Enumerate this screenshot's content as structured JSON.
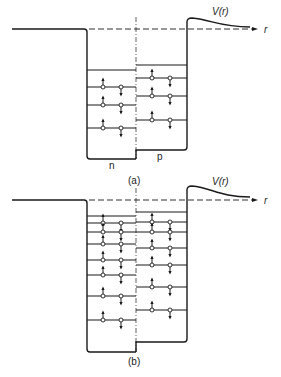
{
  "colors": {
    "line": "#1a1a1a",
    "background": "#ffffff",
    "label": "#222222"
  },
  "icons": {
    "spin_up": "arrow-up",
    "spin_down": "arrow-down",
    "particle": "open-circle"
  },
  "panels": [
    {
      "id": "a",
      "caption": "(a)",
      "potential_label": "V(r)",
      "axis_label": "r",
      "left_region_label": "n",
      "right_region_label": "p",
      "geometry": {
        "baseline_y": 29,
        "left_x": 12,
        "n_wall_x": 87,
        "center_x": 136,
        "p_wall_x": 187,
        "n_bottom_y": 159,
        "p_bottom_y": 150,
        "barrier_peak_y": 18,
        "tail_end_x": 250,
        "tail_end_y": 27,
        "axis_end_x": 258,
        "caption_pos": [
          128,
          176
        ],
        "vr_pos": [
          212,
          7
        ],
        "r_pos": [
          264,
          25
        ],
        "n_pos": [
          109,
          161
        ],
        "p_pos": [
          157,
          152
        ]
      },
      "n_levels": [
        {
          "y": 70,
          "occupied": false
        },
        {
          "y": 87,
          "occupied": true
        },
        {
          "y": 105,
          "occupied": true
        },
        {
          "y": 128,
          "occupied": true
        }
      ],
      "p_levels": [
        {
          "y": 65,
          "occupied": false
        },
        {
          "y": 78,
          "occupied": true
        },
        {
          "y": 96,
          "occupied": true
        },
        {
          "y": 120,
          "occupied": true
        }
      ]
    },
    {
      "id": "b",
      "caption": "(b)",
      "potential_label": "V(r)",
      "axis_label": "r",
      "left_region_label": "",
      "right_region_label": "",
      "geometry": {
        "baseline_y": 200,
        "left_x": 12,
        "n_wall_x": 87,
        "center_x": 136,
        "p_wall_x": 187,
        "n_bottom_y": 352,
        "p_bottom_y": 342,
        "barrier_peak_y": 186,
        "tail_end_x": 250,
        "tail_end_y": 197,
        "axis_end_x": 258,
        "caption_pos": [
          128,
          357
        ],
        "vr_pos": [
          212,
          177
        ],
        "r_pos": [
          264,
          196
        ],
        "n_pos": [
          0,
          0
        ],
        "p_pos": [
          0,
          0
        ]
      },
      "n_levels": [
        {
          "y": 216,
          "occupied": false
        },
        {
          "y": 223,
          "occupied": true
        },
        {
          "y": 232,
          "occupied": true
        },
        {
          "y": 244,
          "occupied": true
        },
        {
          "y": 260,
          "occupied": true
        },
        {
          "y": 275,
          "occupied": true
        },
        {
          "y": 296,
          "occupied": true
        },
        {
          "y": 320,
          "occupied": true
        }
      ],
      "p_levels": [
        {
          "y": 212,
          "occupied": false
        },
        {
          "y": 222,
          "occupied": true
        },
        {
          "y": 232,
          "occupied": true
        },
        {
          "y": 248,
          "occupied": true
        },
        {
          "y": 265,
          "occupied": true
        },
        {
          "y": 287,
          "occupied": true
        },
        {
          "y": 310,
          "occupied": true
        }
      ]
    }
  ],
  "particle_x": {
    "n": [
      103,
      121
    ],
    "p": [
      152,
      170
    ]
  }
}
